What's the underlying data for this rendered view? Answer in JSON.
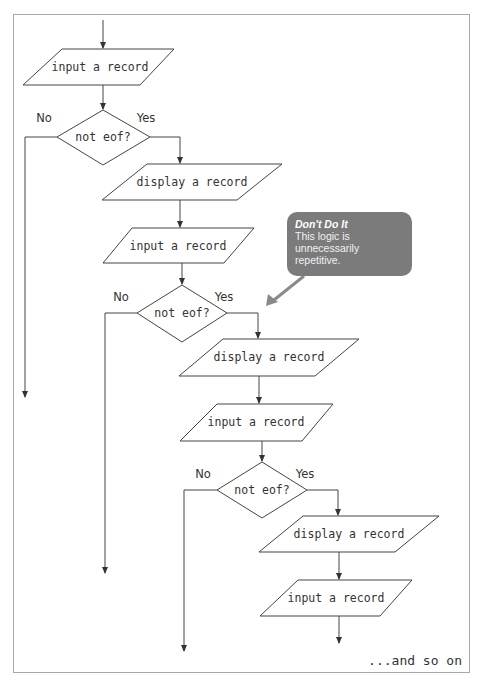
{
  "diagram": {
    "type": "flowchart",
    "colors": {
      "stroke": "#444444",
      "frame": "#a8a8a8",
      "callout_fill": "#7b7b7b",
      "callout_arrow": "#8a8a8a",
      "callout_text": "#f2f2f2"
    },
    "sections": [
      {
        "input": "input a record",
        "decision": "not eof?",
        "no_label": "No",
        "yes_label": "Yes",
        "display": "display a record"
      },
      {
        "input": "input a record",
        "decision": "not eof?",
        "no_label": "No",
        "yes_label": "Yes",
        "display": "display a record"
      },
      {
        "input": "input a record",
        "decision": "not eof?",
        "no_label": "No",
        "yes_label": "Yes",
        "display": "display a record"
      }
    ],
    "final_input": "input a record",
    "footer": "...and so on",
    "callout": {
      "title": "Don't Do It",
      "body": "This logic is unnecessarily repetitive."
    }
  }
}
